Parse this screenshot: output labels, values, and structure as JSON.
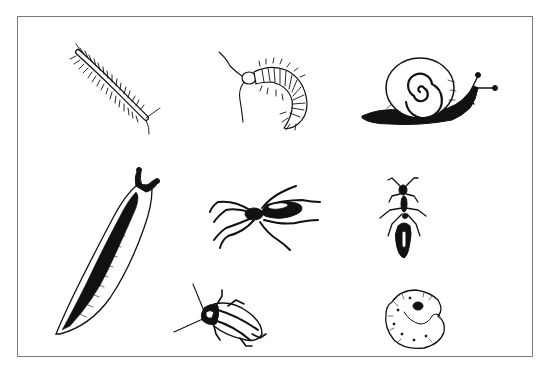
{
  "illustration": {
    "kind": "line-drawing plate of garden invertebrates",
    "background_color": "#ffffff",
    "ink_color": "#111111",
    "frame": {
      "x": 17,
      "y": 16,
      "width": 516,
      "height": 341,
      "border_color": "#7a7a7a"
    },
    "creatures": [
      {
        "id": "millipede",
        "label": "millipede",
        "row": 1,
        "col": 1,
        "bbox": [
          70,
          40,
          100,
          100
        ]
      },
      {
        "id": "centipede",
        "label": "centipede",
        "row": 1,
        "col": 2,
        "bbox": [
          218,
          48,
          95,
          90
        ]
      },
      {
        "id": "snail",
        "label": "snail",
        "row": 1,
        "col": 3,
        "bbox": [
          360,
          60,
          150,
          70
        ]
      },
      {
        "id": "slug",
        "label": "slug",
        "row": 2,
        "col": 1,
        "bbox": [
          50,
          172,
          115,
          165
        ]
      },
      {
        "id": "spider",
        "label": "spider",
        "row": 2,
        "col": 2,
        "bbox": [
          210,
          190,
          115,
          65
        ]
      },
      {
        "id": "ant",
        "label": "ant",
        "row": 2,
        "col": 3,
        "bbox": [
          375,
          165,
          65,
          100
        ]
      },
      {
        "id": "beetle",
        "label": "beetle",
        "row": 3,
        "col": 2,
        "bbox": [
          172,
          282,
          100,
          58
        ]
      },
      {
        "id": "grub",
        "label": "curled grub / larva",
        "row": 3,
        "col": 3,
        "bbox": [
          383,
          290,
          65,
          60
        ]
      }
    ]
  }
}
